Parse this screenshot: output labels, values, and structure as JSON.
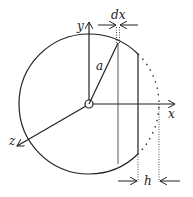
{
  "diagram": {
    "labels": {
      "x_axis": "x",
      "y_axis": "y",
      "z_axis": "z",
      "radius": "a",
      "slice_width": "dx",
      "cap_height": "h"
    },
    "colors": {
      "stroke": "#222222",
      "slice": "#aaaaaa",
      "background": "#ffffff"
    }
  }
}
